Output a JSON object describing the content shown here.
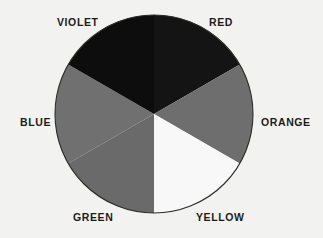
{
  "figure": {
    "name": "color-wheel",
    "background_color": "#f2f2f0",
    "circle": {
      "center_x": 154,
      "center_y": 114,
      "radius": 99,
      "outline_color": "#2a2a2a",
      "outline_width": 1
    }
  },
  "chart_data": {
    "type": "pie",
    "title": "",
    "subtitle": "",
    "xlabel": "",
    "ylabel": "",
    "legend_position": "around-perimeter",
    "grid": false,
    "note": "Six equal 60-degree sectors of a color wheel, rendered in grayscale. Sector boundaries are vertical at 12 o'clock and 6 o'clock.",
    "categories": [
      "RED",
      "ORANGE",
      "YELLOW",
      "GREEN",
      "BLUE",
      "VIOLET"
    ],
    "values": [
      60,
      60,
      60,
      60,
      60,
      60
    ],
    "units": "degrees",
    "slices": [
      {
        "label": "RED",
        "sweep_degrees": 60,
        "start_angle_deg": 0,
        "end_angle_deg": 60,
        "fill": "#141414",
        "label_position": "top-right"
      },
      {
        "label": "ORANGE",
        "sweep_degrees": 60,
        "start_angle_deg": 60,
        "end_angle_deg": 120,
        "fill": "#6e6e6e",
        "label_position": "right"
      },
      {
        "label": "YELLOW",
        "sweep_degrees": 60,
        "start_angle_deg": 120,
        "end_angle_deg": 180,
        "fill": "#f8f8f8",
        "label_position": "bottom-right"
      },
      {
        "label": "GREEN",
        "sweep_degrees": 60,
        "start_angle_deg": 180,
        "end_angle_deg": 240,
        "fill": "#6a6a6a",
        "label_position": "bottom-left"
      },
      {
        "label": "BLUE",
        "sweep_degrees": 60,
        "start_angle_deg": 240,
        "end_angle_deg": 300,
        "fill": "#707070",
        "label_position": "left"
      },
      {
        "label": "VIOLET",
        "sweep_degrees": 60,
        "start_angle_deg": 300,
        "end_angle_deg": 360,
        "fill": "#0d0d0d",
        "label_position": "top-left"
      }
    ]
  },
  "labels": {
    "violet": "VIOLET",
    "red": "RED",
    "blue": "BLUE",
    "orange": "ORANGE",
    "green": "GREEN",
    "yellow": "YELLOW"
  }
}
